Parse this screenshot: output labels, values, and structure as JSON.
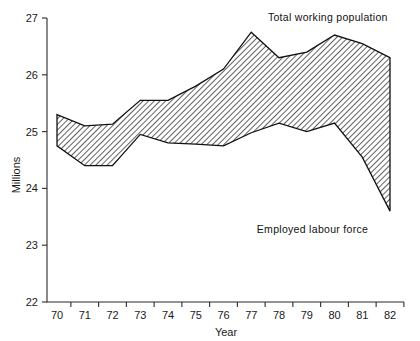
{
  "chart_data": {
    "type": "area",
    "title": "",
    "subtitle": "",
    "xlabel": "Year",
    "ylabel": "Millions",
    "x": [
      70,
      71,
      72,
      73,
      74,
      75,
      76,
      77,
      78,
      79,
      80,
      81,
      82
    ],
    "xtick_labels": [
      "70",
      "71",
      "72",
      "73",
      "74",
      "75",
      "76",
      "77",
      "78",
      "79",
      "80",
      "81",
      "82"
    ],
    "ytick_labels": [
      "22",
      "23",
      "24",
      "25",
      "26",
      "27"
    ],
    "ytick_values": [
      22,
      23,
      24,
      25,
      26,
      27
    ],
    "xlim": [
      69.5,
      82.5
    ],
    "ylim": [
      22,
      27
    ],
    "grid": false,
    "legend_position": "inline-annotations",
    "fill_style": "diagonal-hatch",
    "series": [
      {
        "name": "Total working population",
        "annotation": "Total working population",
        "values": [
          25.3,
          25.1,
          25.13,
          25.55,
          25.55,
          25.8,
          26.1,
          26.75,
          26.3,
          26.4,
          26.7,
          26.55,
          26.3
        ]
      },
      {
        "name": "Employed labour force",
        "annotation": "Employed labour force",
        "values": [
          24.75,
          24.4,
          24.4,
          24.95,
          24.8,
          24.78,
          24.75,
          24.98,
          25.15,
          25.0,
          25.15,
          24.55,
          23.6
        ]
      }
    ],
    "annotations": [
      {
        "text": "Total working population",
        "x": 77.6,
        "y": 26.95,
        "anchor": "start"
      },
      {
        "text": "Employed labour force",
        "x": 77.2,
        "y": 23.22,
        "anchor": "start"
      }
    ],
    "colors": {
      "axis": "#2b2b2b",
      "line": "#111111",
      "hatch": "#3a3a3a",
      "background": "#ffffff"
    }
  }
}
